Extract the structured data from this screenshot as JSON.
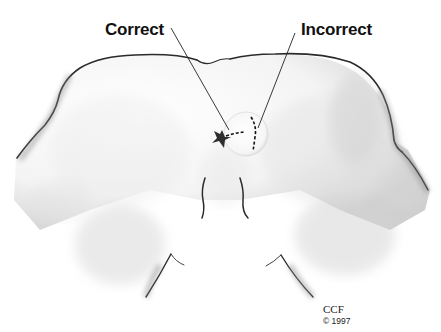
{
  "figure": {
    "labels": {
      "correct": "Correct",
      "incorrect": "Incorrect"
    },
    "credit": {
      "organization": "CCF",
      "copyright": "© 1997"
    },
    "colors": {
      "outline": "#2a2a2a",
      "shading": "#9a9a9a",
      "background": "#ffffff",
      "text": "#111111"
    }
  }
}
